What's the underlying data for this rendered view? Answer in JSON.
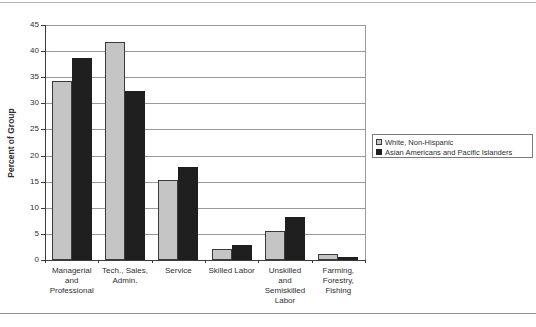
{
  "chart_data": {
    "type": "bar",
    "title": "",
    "xlabel": "",
    "ylabel": "Percent of Group",
    "ylim": [
      0,
      45
    ],
    "y_tick_step": 5,
    "y_ticks": [
      0,
      5,
      10,
      15,
      20,
      25,
      30,
      35,
      40,
      45
    ],
    "grid": true,
    "legend_position": "right",
    "categories": [
      "Managerial and Professional",
      "Tech., Sales, Admin.",
      "Service",
      "Skilled Labor",
      "Unskilled and Semiskilled Labor",
      "Farming, Forestry, Fishing"
    ],
    "category_label_lines": [
      [
        "Managerial",
        "and",
        "Professional"
      ],
      [
        "Tech., Sales,",
        "Admin."
      ],
      [
        "Service"
      ],
      [
        "Skilled Labor"
      ],
      [
        "Unskilled",
        "and",
        "Semiskilled",
        "Labor"
      ],
      [
        "Farming,",
        "Forestry,",
        "Fishing"
      ]
    ],
    "series": [
      {
        "name": "White, Non-Hispanic",
        "color": "#c5c5c5",
        "border_color": "#3a3a3a",
        "values": [
          34.3,
          41.7,
          15.4,
          2.2,
          5.6,
          1.2
        ]
      },
      {
        "name": "Asian Americans and Pacific Islanders",
        "color": "#1f1f1f",
        "border_color": "#1f1f1f",
        "values": [
          38.6,
          32.4,
          17.8,
          2.9,
          8.3,
          0.5
        ]
      }
    ]
  },
  "colors": {
    "background": "#ffffff",
    "gridline": "#9a9a9a",
    "plot_border": "#9a9a9a",
    "axis": "#3c3c3c",
    "text": "#2f2f2f",
    "legend_border": "#7a7a7a",
    "rule_top": "#b3b3b3",
    "rule_bottom": "#8f8f8f"
  }
}
